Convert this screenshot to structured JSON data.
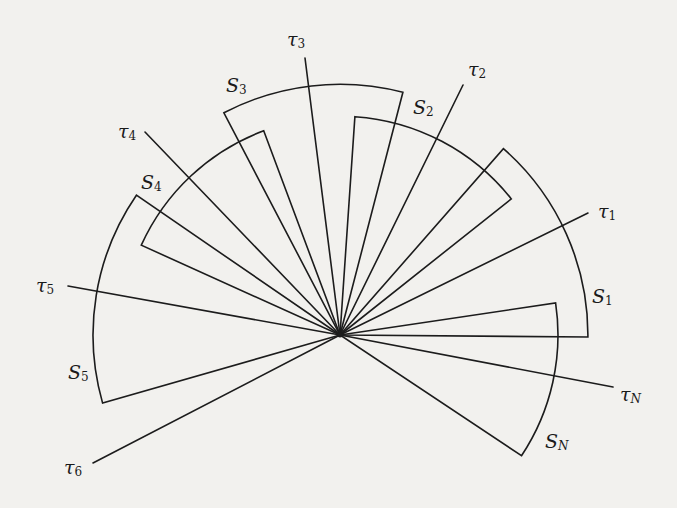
{
  "figure": {
    "center": [
      340,
      335
    ],
    "rays": [
      {
        "name": "tau-1",
        "symbol": "τ",
        "sub": "1",
        "sub_italic": false,
        "end": [
          588,
          213
        ],
        "label_pos": [
          598,
          202
        ]
      },
      {
        "name": "tau-2",
        "symbol": "τ",
        "sub": "2",
        "sub_italic": false,
        "end": [
          463,
          85
        ],
        "label_pos": [
          468,
          60
        ]
      },
      {
        "name": "tau-3",
        "symbol": "τ",
        "sub": "3",
        "sub_italic": false,
        "end": [
          305,
          58
        ],
        "label_pos": [
          287,
          30
        ]
      },
      {
        "name": "tau-4",
        "symbol": "τ",
        "sub": "4",
        "sub_italic": false,
        "end": [
          145,
          132
        ],
        "label_pos": [
          118,
          122
        ]
      },
      {
        "name": "tau-5",
        "symbol": "τ",
        "sub": "5",
        "sub_italic": false,
        "end": [
          68,
          286
        ],
        "label_pos": [
          36,
          276
        ]
      },
      {
        "name": "tau-6",
        "symbol": "τ",
        "sub": "6",
        "sub_italic": false,
        "end": [
          93,
          463
        ],
        "label_pos": [
          64,
          458
        ]
      },
      {
        "name": "tau-n",
        "symbol": "τ",
        "sub": "N",
        "sub_italic": true,
        "end": [
          613,
          387
        ],
        "label_pos": [
          620,
          385
        ]
      }
    ],
    "sectors": [
      {
        "name": "sector-s1",
        "symbol": "S",
        "sub": "1",
        "sub_italic": false,
        "p1": [
          587,
          337
        ],
        "p2": [
          504,
          148
        ],
        "label_pos": [
          592,
          287
        ]
      },
      {
        "name": "sector-s2",
        "symbol": "S",
        "sub": "2",
        "sub_italic": false,
        "p1": [
          510,
          200
        ],
        "p2": [
          355,
          115
        ],
        "label_pos": [
          413,
          98
        ]
      },
      {
        "name": "sector-s3",
        "symbol": "S",
        "sub": "3",
        "sub_italic": false,
        "p1": [
          403,
          92
        ],
        "p2": [
          224,
          113
        ],
        "label_pos": [
          226,
          76
        ]
      },
      {
        "name": "sector-s4",
        "symbol": "S",
        "sub": "4",
        "sub_italic": false,
        "p1": [
          263,
          129
        ],
        "p2": [
          143,
          246
        ],
        "label_pos": [
          141,
          173
        ]
      },
      {
        "name": "sector-s5",
        "symbol": "S",
        "sub": "5",
        "sub_italic": false,
        "p1": [
          136,
          195
        ],
        "p2": [
          103,
          403
        ],
        "label_pos": [
          68,
          363
        ]
      },
      {
        "name": "sector-sn",
        "symbol": "S",
        "sub": "N",
        "sub_italic": true,
        "p1": [
          555,
          303
        ],
        "p2": [
          522,
          456
        ],
        "label_pos": [
          545,
          432
        ]
      }
    ],
    "colors": {
      "ink": "#1c1c1c",
      "paper": "#f2f1ee"
    }
  }
}
